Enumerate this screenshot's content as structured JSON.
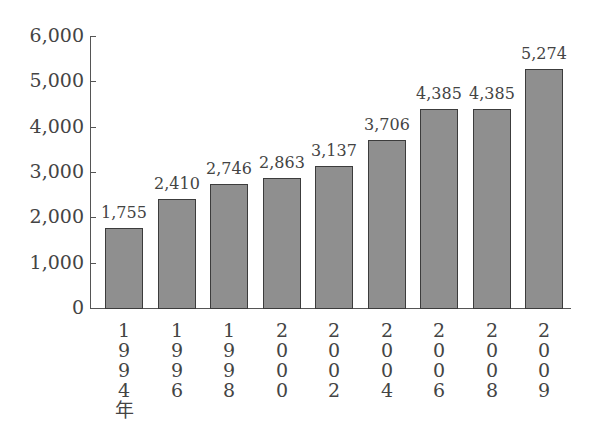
{
  "chart_data": {
    "type": "bar",
    "title": "",
    "xlabel": "",
    "ylabel": "",
    "ylim": [
      0,
      6000
    ],
    "yticks": [
      0,
      1000,
      2000,
      3000,
      4000,
      5000,
      6000
    ],
    "ytick_labels": [
      "0",
      "1,000",
      "2,000",
      "3,000",
      "4,000",
      "5,000",
      "6,000"
    ],
    "categories": [
      "1994年",
      "1996",
      "1998",
      "2000",
      "2002",
      "2004",
      "2006",
      "2008",
      "2009"
    ],
    "category_labels_vertical": [
      "1\n9\n9\n4\n年",
      "1\n9\n9\n6",
      "1\n9\n9\n8",
      "2\n0\n0\n0",
      "2\n0\n0\n2",
      "2\n0\n0\n4",
      "2\n0\n0\n6",
      "2\n0\n0\n8",
      "2\n0\n0\n9"
    ],
    "values": [
      1755,
      2410,
      2746,
      2863,
      3137,
      3706,
      4385,
      4385,
      5274
    ],
    "value_labels": [
      "1,755",
      "2,410",
      "2,746",
      "2,863",
      "3,137",
      "3,706",
      "4,385",
      "4,385",
      "5,274"
    ],
    "grid": false,
    "legend": null,
    "bar_color": "#8f8f8f",
    "bar_edge_color": "#3c3c3c"
  }
}
